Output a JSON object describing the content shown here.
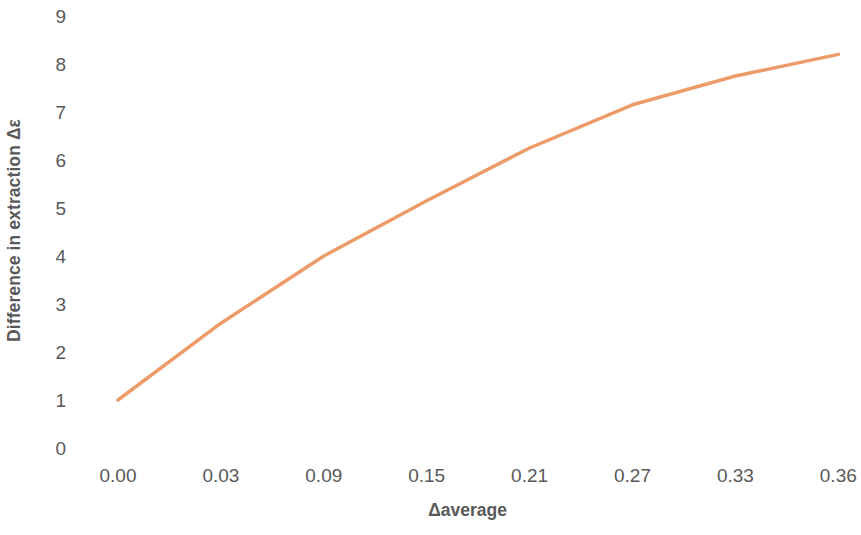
{
  "chart_data": {
    "type": "line",
    "title": "",
    "subtitle": "",
    "xlabel": "Δaverage",
    "ylabel": "Difference in extraction Δε",
    "categories": [
      "0.00",
      "0.03",
      "0.09",
      "0.15",
      "0.21",
      "0.27",
      "0.33",
      "0.36"
    ],
    "x_numeric": [
      0.0,
      0.03,
      0.09,
      0.15,
      0.21,
      0.27,
      0.33,
      0.36
    ],
    "values": [
      1.0,
      2.6,
      4.0,
      5.15,
      6.25,
      7.15,
      7.75,
      8.2
    ],
    "series": [
      {
        "name": "Difference in extraction",
        "values": [
          1.0,
          2.6,
          4.0,
          5.15,
          6.25,
          7.15,
          7.75,
          8.2
        ],
        "color": "#ED9B69"
      }
    ],
    "y_ticks": [
      "0",
      "1",
      "2",
      "3",
      "4",
      "5",
      "6",
      "7",
      "8",
      "9"
    ],
    "y_tick_values": [
      0,
      1,
      2,
      3,
      4,
      5,
      6,
      7,
      8,
      9
    ],
    "ylim": [
      0,
      9
    ],
    "xlim_category_index": [
      0,
      7
    ],
    "grid": false,
    "legend": false,
    "legend_position": "none",
    "axis_lines": false,
    "markers": false,
    "line_width_px": 3.5,
    "background_color": "#FFFFFF",
    "text_color": "#595959",
    "annotations": []
  }
}
